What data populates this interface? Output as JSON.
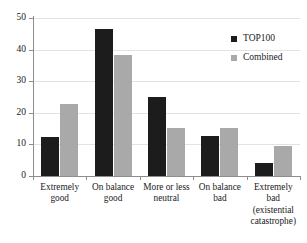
{
  "chart_data": {
    "type": "bar",
    "title": "",
    "subtitle": "",
    "xlabel": "",
    "ylabel": "",
    "ylim": [
      0,
      50
    ],
    "yticks": [
      0,
      10,
      20,
      30,
      40,
      50
    ],
    "ytick_labels": [
      "0",
      "10",
      "20",
      "30",
      "40",
      "50"
    ],
    "grid": true,
    "legend_position": "top-right",
    "categories": [
      "Extremely good",
      "On balance good",
      "More or less neutral",
      "On balance bad",
      "Extremely bad (existential catastrophe)"
    ],
    "category_label_lines": [
      [
        "Extremely",
        "good"
      ],
      [
        "On balance",
        "good"
      ],
      [
        "More or less",
        "neutral"
      ],
      [
        "On balance",
        "bad"
      ],
      [
        "Extremely",
        "bad",
        "(existential",
        "catastrophe)"
      ]
    ],
    "series": [
      {
        "name": "TOP100",
        "color": "#1c1c1c",
        "values": [
          12.5,
          46.5,
          25.0,
          12.7,
          4.2
        ]
      },
      {
        "name": "Combined",
        "color": "#a9a9a9",
        "values": [
          22.8,
          38.2,
          15.2,
          15.2,
          9.5
        ]
      }
    ]
  },
  "legend": {
    "items": [
      {
        "label": "TOP100",
        "color": "#1c1c1c"
      },
      {
        "label": "Combined",
        "color": "#a9a9a9"
      }
    ]
  },
  "axes": {
    "y_max_label": "50",
    "y_min_label": "0"
  }
}
